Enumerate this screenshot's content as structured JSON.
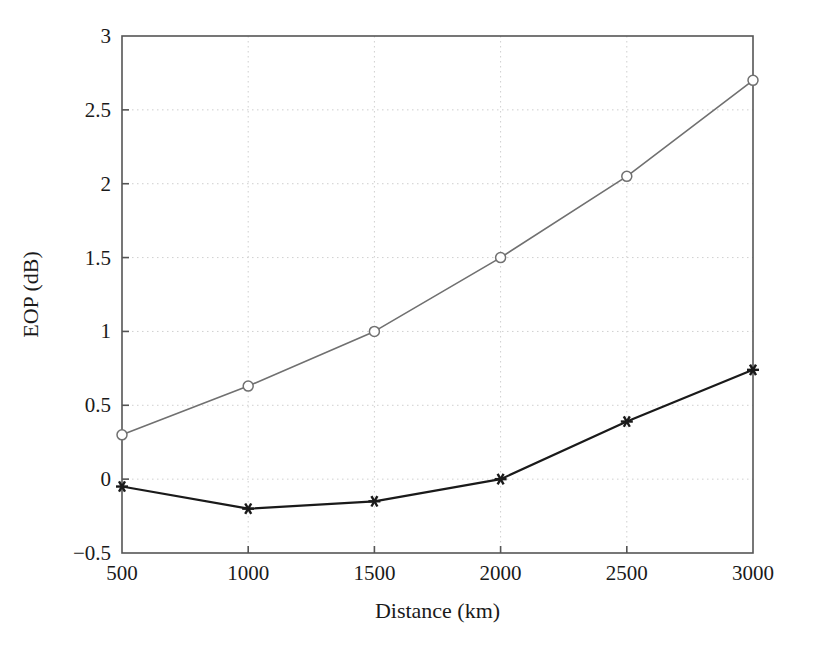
{
  "chart_data": {
    "type": "line",
    "title": "",
    "xlabel": "Distance (km)",
    "ylabel": "EOP (dB)",
    "x": [
      500,
      1000,
      1500,
      2000,
      2500,
      3000
    ],
    "xlim": [
      500,
      3000
    ],
    "ylim": [
      -0.5,
      3
    ],
    "xticks": [
      500,
      1000,
      1500,
      2000,
      2500,
      3000
    ],
    "xtick_labels": [
      "500",
      "1000",
      "1500",
      "2000",
      "2500",
      "3000"
    ],
    "yticks": [
      -0.5,
      0,
      0.5,
      1,
      1.5,
      2,
      2.5,
      3
    ],
    "ytick_labels": [
      "−0.5",
      "0",
      "0.5",
      "1",
      "1.5",
      "2",
      "2.5",
      "3"
    ],
    "grid": true,
    "grid_style": "dotted",
    "grid_color": "#cfcfcf",
    "legend": "none",
    "axis_color": "#555555",
    "background": "#ffffff",
    "series": [
      {
        "name": "upper-curve",
        "marker": "circle-open",
        "color": "#707070",
        "line_width": 1.6,
        "marker_size": 7,
        "values": [
          0.3,
          0.63,
          1.0,
          1.5,
          2.05,
          2.7
        ]
      },
      {
        "name": "lower-curve",
        "marker": "asterisk",
        "color": "#1a1a1a",
        "line_width": 2.2,
        "marker_size": 9,
        "values": [
          -0.05,
          -0.2,
          -0.15,
          0.0,
          0.39,
          0.74
        ]
      }
    ]
  },
  "layout": {
    "plot_left": 122,
    "plot_right": 753,
    "plot_top": 36,
    "plot_bottom": 553,
    "tick_length": 7,
    "width": 813,
    "height": 646
  }
}
